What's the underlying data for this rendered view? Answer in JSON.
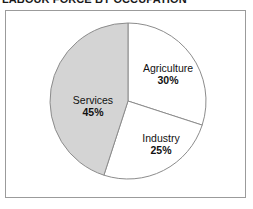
{
  "heading": {
    "text": "LABOUR FORCE BY OCCUPATION"
  },
  "frame": {
    "border_color": "#9b9b9b",
    "background": "#ffffff"
  },
  "chart_data": {
    "type": "pie",
    "title": "LABOUR FORCE BY OCCUPATION",
    "categories": [
      "Agriculture",
      "Industry",
      "Services"
    ],
    "values": [
      30,
      25,
      45
    ],
    "value_unit": "%",
    "labels": [
      "30%",
      "25%",
      "45%"
    ],
    "colors": [
      "#ffffff",
      "#ffffff",
      "#d4d4d4"
    ],
    "slice_outline_color": "#8c8c8c",
    "start_angle_deg": 0,
    "direction": "clockwise",
    "legend": "none",
    "grid": false,
    "slices": [
      {
        "name": "Agriculture",
        "value": 30,
        "label": "30%",
        "fill": "#ffffff",
        "start_deg": 0,
        "end_deg": 108
      },
      {
        "name": "Industry",
        "value": 25,
        "label": "25%",
        "fill": "#ffffff",
        "start_deg": 108,
        "end_deg": 198
      },
      {
        "name": "Services",
        "value": 45,
        "label": "45%",
        "fill": "#d4d4d4",
        "start_deg": 198,
        "end_deg": 360
      }
    ]
  }
}
